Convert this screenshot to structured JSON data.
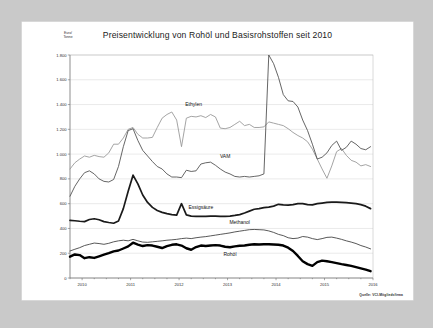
{
  "card": {
    "title": "Preisentwicklung von Rohöl und Basisrohstoffen seit 2010",
    "unit_label_line1": "Euro/",
    "unit_label_line2": "Tonne",
    "source_note": "Quelle: VCI-Mitgliedsfirma"
  },
  "chart_data": {
    "type": "line",
    "title": "Preisentwicklung von Rohöl und Basisrohstoffen seit 2010",
    "xlabel": "",
    "ylabel": "Euro/Tonne",
    "ylim": [
      0,
      1800
    ],
    "xlim": [
      2009.75,
      2016.0
    ],
    "grid": true,
    "legend": "inline-labels",
    "yticks": [
      0,
      200,
      400,
      600,
      800,
      1000,
      1200,
      1400,
      1600,
      1800
    ],
    "ytick_labels": [
      "0",
      "200",
      "400",
      "600",
      "800",
      "1.000",
      "1.200",
      "1.400",
      "1.600",
      "1.800"
    ],
    "xticks": [
      2010,
      2011,
      2012,
      2013,
      2014,
      2015,
      2016
    ],
    "xtick_labels": [
      "2010",
      "2011",
      "2012",
      "2013",
      "2014",
      "2015",
      "2016"
    ],
    "x": [
      2009.75,
      2009.85,
      2009.95,
      2010.05,
      2010.15,
      2010.25,
      2010.35,
      2010.45,
      2010.55,
      2010.65,
      2010.75,
      2010.85,
      2010.95,
      2011.05,
      2011.15,
      2011.25,
      2011.35,
      2011.45,
      2011.55,
      2011.65,
      2011.75,
      2011.85,
      2011.95,
      2012.05,
      2012.15,
      2012.25,
      2012.35,
      2012.45,
      2012.55,
      2012.65,
      2012.75,
      2012.85,
      2012.95,
      2013.05,
      2013.15,
      2013.25,
      2013.35,
      2013.45,
      2013.55,
      2013.65,
      2013.75,
      2013.85,
      2013.95,
      2014.05,
      2014.15,
      2014.25,
      2014.35,
      2014.45,
      2014.55,
      2014.65,
      2014.75,
      2014.85,
      2014.95,
      2015.05,
      2015.15,
      2015.25,
      2015.35,
      2015.45,
      2015.55,
      2015.65,
      2015.75,
      2015.85,
      2015.95
    ],
    "series": [
      {
        "name": "Ethylen",
        "color": "#9a9a9a",
        "width": 0.9,
        "label_x": 2012.3,
        "label_y": 1390,
        "values": [
          880,
          930,
          960,
          985,
          975,
          990,
          980,
          975,
          1010,
          1080,
          1080,
          1130,
          1200,
          1215,
          1160,
          1130,
          1130,
          1135,
          1215,
          1290,
          1320,
          1340,
          1275,
          1060,
          1290,
          1305,
          1300,
          1310,
          1295,
          1320,
          1300,
          1210,
          1205,
          1215,
          1240,
          1265,
          1230,
          1240,
          1215,
          1215,
          1220,
          1260,
          1250,
          1240,
          1230,
          1205,
          1175,
          1150,
          1130,
          1100,
          1040,
          960,
          880,
          805,
          905,
          1020,
          1045,
          990,
          950,
          935,
          905,
          915,
          900
        ]
      },
      {
        "name": "VAM",
        "color": "#4a4a4a",
        "width": 0.85,
        "label_x": 2012.95,
        "label_y": 965,
        "values": [
          660,
          740,
          800,
          850,
          865,
          840,
          800,
          780,
          775,
          795,
          900,
          1060,
          1190,
          1205,
          1110,
          1030,
          985,
          940,
          900,
          880,
          840,
          815,
          815,
          810,
          870,
          860,
          865,
          920,
          930,
          935,
          910,
          880,
          855,
          840,
          820,
          815,
          820,
          815,
          820,
          825,
          840,
          1800,
          1730,
          1620,
          1480,
          1430,
          1425,
          1380,
          1275,
          1190,
          1080,
          960,
          975,
          1010,
          1070,
          1105,
          1030,
          1055,
          1105,
          1080,
          1045,
          1035,
          1060
        ]
      },
      {
        "name": "Essigsäure",
        "color": "#1a1a1a",
        "width": 1.7,
        "label_x": 2012.45,
        "label_y": 560,
        "values": [
          465,
          462,
          458,
          455,
          472,
          478,
          470,
          455,
          448,
          442,
          460,
          560,
          700,
          830,
          760,
          670,
          610,
          570,
          545,
          530,
          520,
          512,
          508,
          600,
          510,
          500,
          498,
          497,
          498,
          500,
          500,
          498,
          497,
          500,
          505,
          512,
          525,
          540,
          555,
          560,
          568,
          572,
          580,
          595,
          590,
          588,
          592,
          600,
          600,
          592,
          590,
          600,
          605,
          610,
          612,
          612,
          610,
          608,
          605,
          600,
          592,
          580,
          560
        ]
      },
      {
        "name": "Methanol",
        "color": "#3a3a3a",
        "width": 0.85,
        "label_x": 2013.25,
        "label_y": 432,
        "values": [
          218,
          232,
          245,
          262,
          272,
          282,
          278,
          272,
          280,
          292,
          300,
          305,
          300,
          312,
          300,
          290,
          288,
          292,
          296,
          300,
          305,
          308,
          312,
          318,
          322,
          318,
          325,
          330,
          334,
          340,
          346,
          352,
          358,
          364,
          372,
          378,
          384,
          390,
          392,
          390,
          388,
          380,
          368,
          352,
          342,
          325,
          318,
          322,
          335,
          330,
          318,
          310,
          318,
          328,
          330,
          322,
          312,
          300,
          290,
          278,
          262,
          250,
          235
        ]
      },
      {
        "name": "Rohöl",
        "color": "#000000",
        "width": 2.4,
        "label_x": 2013.05,
        "label_y": 180,
        "values": [
          172,
          190,
          185,
          160,
          168,
          162,
          175,
          188,
          200,
          215,
          222,
          238,
          255,
          285,
          270,
          258,
          265,
          262,
          252,
          242,
          258,
          268,
          272,
          262,
          240,
          228,
          250,
          262,
          258,
          262,
          265,
          262,
          252,
          248,
          255,
          260,
          262,
          268,
          272,
          270,
          272,
          272,
          270,
          268,
          262,
          245,
          218,
          178,
          135,
          112,
          98,
          128,
          140,
          135,
          128,
          120,
          112,
          105,
          98,
          88,
          78,
          68,
          55
        ]
      }
    ]
  }
}
